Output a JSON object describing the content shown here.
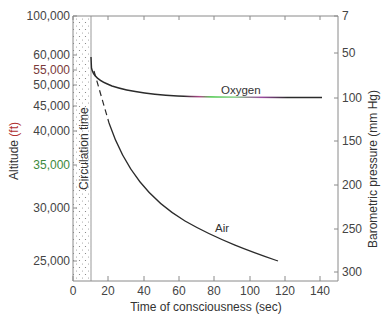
{
  "chart_data": {
    "type": "line",
    "title": "",
    "xlabel": "Time of consciousness (sec)",
    "ylabel_left": "Altitude (ft)",
    "ylabel_right": "Barometric pressure (mm Hg)",
    "xlim": [
      0,
      150
    ],
    "x_ticks": [
      0,
      20,
      40,
      60,
      80,
      100,
      120,
      140
    ],
    "y_left_ticks": [
      "100,000",
      "60,000",
      "55,000",
      "50,000",
      "45,000",
      "40,000",
      "35,000",
      "30,000",
      "25,000"
    ],
    "y_right_ticks": [
      "7",
      "50",
      "100",
      "150",
      "200",
      "250",
      "300"
    ],
    "grid": false,
    "shaded_region": {
      "label": "Circulation time",
      "x_range": [
        0,
        10
      ]
    },
    "series": [
      {
        "name": "Oxygen",
        "x": [
          10,
          11,
          13,
          16,
          20,
          30,
          40,
          60,
          80,
          100,
          120,
          140
        ],
        "altitude_ft": [
          60000,
          54000,
          52500,
          51500,
          50500,
          49500,
          48500,
          47700,
          47500,
          47300,
          47300,
          47300
        ],
        "pressure_mmHg": [
          50,
          72,
          78,
          82,
          86,
          90,
          93,
          97,
          98,
          99,
          99,
          99
        ]
      },
      {
        "name": "Air",
        "x": [
          12,
          17,
          20,
          30,
          40,
          50,
          60,
          70,
          80,
          90,
          100,
          110,
          117
        ],
        "altitude_ft": [
          55000,
          42000,
          40000,
          35500,
          32500,
          30500,
          29000,
          27800,
          26900,
          26200,
          25600,
          25100,
          24800
        ],
        "pressure_mmHg": [
          70,
          125,
          135,
          165,
          185,
          205,
          220,
          232,
          242,
          250,
          256,
          262,
          265
        ],
        "dashed_segment_x": [
          12,
          17
        ]
      }
    ]
  },
  "labels": {
    "oxygen": "Oxygen",
    "air": "Air",
    "circulation": "Circulation time",
    "xlabel": "Time of consciousness (sec)",
    "ylabel_left_main": "Altitude ",
    "ylabel_left_unit": "(ft)",
    "ylabel_right": "Barometric pressure (mm Hg)"
  },
  "ticks": {
    "x": [
      {
        "label": "0",
        "px": 73
      },
      {
        "label": "20",
        "px": 108
      },
      {
        "label": "40",
        "px": 144
      },
      {
        "label": "60",
        "px": 179
      },
      {
        "label": "80",
        "px": 214
      },
      {
        "label": "100",
        "px": 250
      },
      {
        "label": "120",
        "px": 285
      },
      {
        "label": "140",
        "px": 320
      }
    ],
    "left": [
      {
        "label": "100,000",
        "py": 16,
        "color": "#444444"
      },
      {
        "label": "60,000",
        "py": 55,
        "color": "#444444"
      },
      {
        "label": "55,000",
        "py": 70,
        "color": "#7a3a3a"
      },
      {
        "label": "50,000",
        "py": 85,
        "color": "#444444"
      },
      {
        "label": "45,000",
        "py": 106,
        "color": "#444444"
      },
      {
        "label": "40,000",
        "py": 131,
        "color": "#444444"
      },
      {
        "label": "35,000",
        "py": 165,
        "color": "#3d8a3d"
      },
      {
        "label": "30,000",
        "py": 208,
        "color": "#444444"
      },
      {
        "label": "25,000",
        "py": 261,
        "color": "#444444"
      }
    ],
    "right": [
      {
        "label": "7",
        "py": 16
      },
      {
        "label": "50",
        "py": 53
      },
      {
        "label": "100",
        "py": 98
      },
      {
        "label": "150",
        "py": 141
      },
      {
        "label": "200",
        "py": 185
      },
      {
        "label": "250",
        "py": 229
      },
      {
        "label": "300",
        "py": 272
      }
    ]
  },
  "colors": {
    "axis": "#8a8a8a",
    "curve": "#2b2b2b",
    "oxygen_gradient": [
      "#2b2b2b",
      "#b04a8a",
      "#4ac84a",
      "#8ad08a",
      "#9a4aa0",
      "#2b2b2b"
    ],
    "unit_red": "#b03030"
  }
}
